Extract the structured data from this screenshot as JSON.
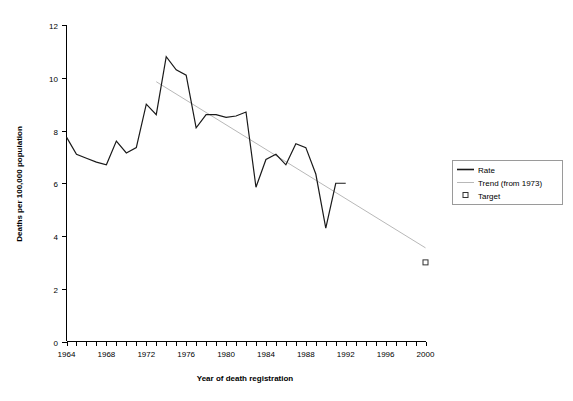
{
  "chart_data": {
    "type": "line",
    "title": "",
    "xlabel": "Year of death registration",
    "ylabel": "Deaths per 100,000 population",
    "xlim": [
      1964,
      2000
    ],
    "ylim": [
      0,
      12
    ],
    "grid": false,
    "legend_position": "right",
    "x_tick_labels": [
      "1964",
      "1968",
      "1972",
      "1976",
      "1980",
      "1984",
      "1988",
      "1992",
      "1996",
      "2000"
    ],
    "x_tick_values": [
      1964,
      1968,
      1972,
      1976,
      1980,
      1984,
      1988,
      1992,
      1996,
      2000
    ],
    "x_minor_ticks": [
      1964,
      1965,
      1966,
      1967,
      1968,
      1969,
      1970,
      1971,
      1972,
      1973,
      1974,
      1975,
      1976,
      1977,
      1978,
      1979,
      1980,
      1981,
      1982,
      1983,
      1984,
      1985,
      1986,
      1987,
      1988,
      1989,
      1990,
      1991,
      1992,
      1993,
      1994,
      1995,
      1996,
      1997,
      1998,
      1999,
      2000
    ],
    "y_tick_labels": [
      "0",
      "2",
      "4",
      "6",
      "8",
      "10",
      "12"
    ],
    "y_tick_values": [
      0,
      2,
      4,
      6,
      8,
      10,
      12
    ],
    "series": [
      {
        "name": "Rate",
        "type": "line",
        "color": "#1a1a1a",
        "x": [
          1964,
          1965,
          1966,
          1967,
          1968,
          1969,
          1970,
          1971,
          1972,
          1973,
          1974,
          1975,
          1976,
          1977,
          1978,
          1979,
          1980,
          1981,
          1982,
          1983,
          1984,
          1985,
          1986,
          1987,
          1988,
          1989,
          1990,
          1991,
          1992
        ],
        "values": [
          7.75,
          7.1,
          6.95,
          6.8,
          6.7,
          7.6,
          7.15,
          7.35,
          9.0,
          8.6,
          10.8,
          10.3,
          10.1,
          8.1,
          8.6,
          8.6,
          8.5,
          8.55,
          8.7,
          5.85,
          6.9,
          7.1,
          6.7,
          7.5,
          7.35,
          6.35,
          4.3,
          6.0,
          6.0
        ]
      },
      {
        "name": "Trend (from 1973)",
        "type": "line",
        "color": "#b8b8b8",
        "x": [
          1973,
          2000
        ],
        "values": [
          9.85,
          3.55
        ]
      },
      {
        "name": "Target",
        "type": "scatter",
        "marker": "square",
        "color": "#333333",
        "x": [
          2000
        ],
        "values": [
          3.0
        ]
      }
    ],
    "legend": [
      {
        "label": "Rate",
        "marker": "line",
        "color": "#1a1a1a"
      },
      {
        "label": "Trend (from 1973)",
        "marker": "line",
        "color": "#b8b8b8"
      },
      {
        "label": "Target",
        "marker": "square",
        "color": "#333333"
      }
    ]
  }
}
